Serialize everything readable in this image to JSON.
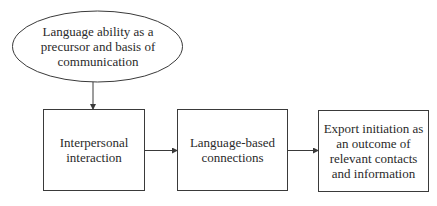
{
  "diagram": {
    "type": "flowchart",
    "nodes": [
      {
        "id": "n1",
        "shape": "ellipse",
        "lines": [
          "Language ability as a",
          "precursor and basis of",
          "communication"
        ]
      },
      {
        "id": "n2",
        "shape": "rectangle",
        "lines": [
          "Interpersonal",
          "interaction"
        ]
      },
      {
        "id": "n3",
        "shape": "rectangle",
        "lines": [
          "Language-based",
          "connections"
        ]
      },
      {
        "id": "n4",
        "shape": "rectangle",
        "lines": [
          "Export initiation as",
          "an outcome of",
          "relevant contacts",
          "and information"
        ]
      }
    ],
    "edges": [
      {
        "from": "n1",
        "to": "n2",
        "direction": "down"
      },
      {
        "from": "n2",
        "to": "n3",
        "direction": "right"
      },
      {
        "from": "n3",
        "to": "n4",
        "direction": "right"
      }
    ],
    "colors": {
      "stroke": "#3a3a3a",
      "text": "#2a2a2a",
      "background": "#ffffff"
    }
  }
}
